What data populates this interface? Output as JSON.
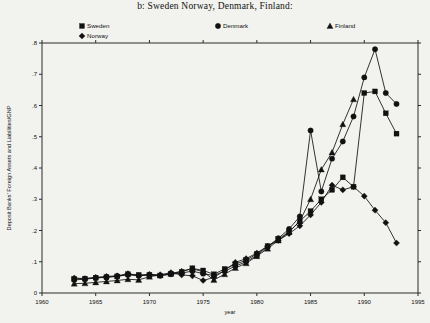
{
  "chart_data": {
    "type": "line",
    "title": "b:  Sweden Norway, Denmark, Finland:",
    "xlabel": "year",
    "ylabel": "Deposit Banks' Foreign Assets and Liabilities/GNP",
    "xlim": [
      1960,
      1995
    ],
    "ylim": [
      0,
      0.8
    ],
    "xticks": [
      1960,
      1965,
      1970,
      1975,
      1980,
      1985,
      1990,
      1995
    ],
    "xticklabels": [
      "1960",
      "1965",
      "1970",
      "1975",
      "1980",
      "1985",
      "1990",
      "1995"
    ],
    "yticks": [
      0,
      0.1,
      0.2,
      0.3,
      0.4,
      0.5,
      0.6,
      0.7,
      0.8
    ],
    "yticklabels": [
      "0",
      ".1",
      ".2",
      ".3",
      ".4",
      ".5",
      ".6",
      ".7",
      ".8"
    ],
    "grid": false,
    "legend_position": "above-plot",
    "series": [
      {
        "name": "Sweden",
        "marker": "square",
        "x": [
          1963,
          1964,
          1965,
          1966,
          1967,
          1968,
          1969,
          1970,
          1971,
          1972,
          1973,
          1974,
          1975,
          1976,
          1977,
          1978,
          1979,
          1980,
          1981,
          1982,
          1983,
          1984,
          1985,
          1986,
          1987,
          1988,
          1989,
          1990,
          1991,
          1992,
          1993
        ],
        "values": [
          0.045,
          0.046,
          0.049,
          0.051,
          0.053,
          0.06,
          0.058,
          0.058,
          0.056,
          0.062,
          0.068,
          0.079,
          0.072,
          0.06,
          0.077,
          0.092,
          0.105,
          0.125,
          0.15,
          0.172,
          0.196,
          0.23,
          0.262,
          0.3,
          0.33,
          0.37,
          0.34,
          0.64,
          0.645,
          0.575,
          0.51
        ]
      },
      {
        "name": "Norway",
        "marker": "diamond",
        "x": [
          1963,
          1964,
          1965,
          1966,
          1967,
          1968,
          1969,
          1970,
          1971,
          1972,
          1973,
          1974,
          1975,
          1976,
          1977,
          1978,
          1979,
          1980,
          1981,
          1982,
          1983,
          1984,
          1985,
          1986,
          1987,
          1988,
          1989,
          1990,
          1991,
          1992,
          1993
        ],
        "values": [
          0.048,
          0.046,
          0.05,
          0.053,
          0.055,
          0.062,
          0.056,
          0.06,
          0.058,
          0.065,
          0.058,
          0.055,
          0.04,
          0.05,
          0.072,
          0.098,
          0.11,
          0.128,
          0.15,
          0.168,
          0.19,
          0.215,
          0.25,
          0.29,
          0.345,
          0.33,
          0.34,
          0.31,
          0.265,
          0.225,
          0.16
        ]
      },
      {
        "name": "Denmark",
        "marker": "circle",
        "x": [
          1963,
          1964,
          1965,
          1966,
          1967,
          1968,
          1969,
          1970,
          1971,
          1972,
          1973,
          1974,
          1975,
          1976,
          1977,
          1978,
          1979,
          1980,
          1981,
          1982,
          1983,
          1984,
          1985,
          1986,
          1987,
          1988,
          1989,
          1990,
          1991,
          1992,
          1993
        ],
        "values": [
          0.042,
          0.044,
          0.048,
          0.05,
          0.054,
          0.058,
          0.055,
          0.057,
          0.055,
          0.06,
          0.064,
          0.07,
          0.062,
          0.056,
          0.07,
          0.086,
          0.1,
          0.12,
          0.148,
          0.175,
          0.205,
          0.245,
          0.52,
          0.325,
          0.43,
          0.485,
          0.565,
          0.69,
          0.78,
          0.64,
          0.605
        ]
      },
      {
        "name": "Finland",
        "marker": "triangle",
        "x": [
          1963,
          1964,
          1965,
          1966,
          1967,
          1968,
          1969,
          1970,
          1971,
          1972,
          1973,
          1974,
          1975,
          1976,
          1977,
          1978,
          1979,
          1980,
          1981,
          1982,
          1983,
          1984,
          1985,
          1986,
          1987,
          1988,
          1989
        ],
        "values": [
          0.03,
          0.031,
          0.034,
          0.037,
          0.04,
          0.044,
          0.042,
          0.052,
          0.058,
          0.062,
          0.07,
          0.078,
          0.068,
          0.042,
          0.06,
          0.08,
          0.095,
          0.118,
          0.142,
          0.168,
          0.195,
          0.23,
          0.3,
          0.395,
          0.45,
          0.54,
          0.62
        ]
      }
    ],
    "legend": [
      {
        "label": "Sweden",
        "marker": "square"
      },
      {
        "label": "Denmark",
        "marker": "circle"
      },
      {
        "label": "Finland",
        "marker": "triangle"
      },
      {
        "label": "Norway",
        "marker": "diamond"
      }
    ],
    "colors": {
      "ink": "#111111",
      "background": "#f2f2ee"
    }
  }
}
